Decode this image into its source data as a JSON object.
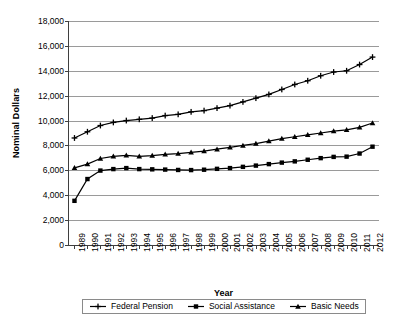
{
  "chart_data": {
    "type": "line",
    "title": "",
    "xlabel": "Year",
    "ylabel": "Nominal Dollars",
    "ylim": [
      0,
      18000
    ],
    "ytick_step": 2000,
    "ytick_labels": [
      "18,000",
      "16,000",
      "14,000",
      "12,000",
      "10,000",
      "8,000",
      "6,000",
      "4,000",
      "2,000",
      "0"
    ],
    "grid": true,
    "legend_position": "bottom",
    "categories": [
      1989,
      1990,
      1991,
      1992,
      1993,
      1994,
      1995,
      1996,
      1997,
      1998,
      1999,
      2000,
      2001,
      2002,
      2003,
      2004,
      2005,
      2006,
      2007,
      2008,
      2009,
      2010,
      2011,
      2012
    ],
    "xtick_labels": [
      "1989",
      "1990",
      "1991",
      "1992",
      "1993",
      "1994",
      "1995",
      "1996",
      "1997",
      "1998",
      "1999",
      "2000",
      "2001",
      "2002",
      "2003",
      "2004",
      "2005",
      "2006",
      "2007",
      "2008",
      "2009",
      "2010",
      "2011",
      "2012"
    ],
    "series": [
      {
        "name": "Federal Pension",
        "marker": "plus",
        "color": "#000000",
        "values": [
          8600,
          9100,
          9600,
          9850,
          10000,
          10100,
          10200,
          10400,
          10500,
          10700,
          10800,
          11000,
          11200,
          11500,
          11800,
          12100,
          12500,
          12900,
          13200,
          13600,
          13900,
          14000,
          14500,
          15100
        ]
      },
      {
        "name": "Social Assistance",
        "marker": "square",
        "color": "#000000",
        "values": [
          3550,
          5300,
          5980,
          6100,
          6180,
          6100,
          6080,
          6060,
          6030,
          6020,
          6050,
          6120,
          6180,
          6280,
          6380,
          6500,
          6620,
          6720,
          6850,
          6980,
          7080,
          7100,
          7350,
          7900
        ]
      },
      {
        "name": "Basic Needs",
        "marker": "triangle",
        "color": "#000000",
        "values": [
          6200,
          6500,
          6950,
          7120,
          7200,
          7120,
          7180,
          7280,
          7350,
          7450,
          7550,
          7700,
          7850,
          8000,
          8150,
          8350,
          8550,
          8700,
          8850,
          9000,
          9150,
          9250,
          9450,
          9800
        ]
      }
    ]
  },
  "legend": {
    "items": [
      {
        "label": "Federal Pension"
      },
      {
        "label": "Social Assistance"
      },
      {
        "label": "Basic Needs"
      }
    ]
  }
}
